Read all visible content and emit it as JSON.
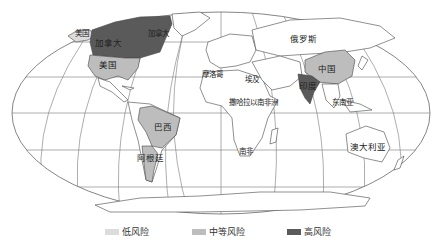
{
  "map": {
    "projection": "robinson-like world map",
    "colors": {
      "ocean": "#ffffff",
      "land": "#ffffff",
      "border": "#555555",
      "graticule": "#777777",
      "low": "#dcdcdc",
      "medium": "#bdbdbd",
      "high": "#5a5a5a"
    },
    "labels": [
      {
        "text": "美国",
        "x": 82,
        "y": 34,
        "small": true
      },
      {
        "text": "加拿大",
        "x": 108,
        "y": 43
      },
      {
        "text": "加拿大",
        "x": 158,
        "y": 34,
        "small": true
      },
      {
        "text": "美国",
        "x": 108,
        "y": 65
      },
      {
        "text": "俄罗斯",
        "x": 303,
        "y": 39
      },
      {
        "text": "中国",
        "x": 327,
        "y": 69
      },
      {
        "text": "印度",
        "x": 308,
        "y": 86
      },
      {
        "text": "摩洛哥",
        "x": 212,
        "y": 75,
        "small": true
      },
      {
        "text": "埃及",
        "x": 252,
        "y": 80,
        "small": true
      },
      {
        "text": "撒哈拉以南非洲",
        "x": 253,
        "y": 103,
        "small": true
      },
      {
        "text": "东南亚",
        "x": 342,
        "y": 103,
        "small": true
      },
      {
        "text": "巴西",
        "x": 163,
        "y": 127
      },
      {
        "text": "阿根廷",
        "x": 150,
        "y": 158
      },
      {
        "text": "南非",
        "x": 246,
        "y": 152,
        "small": true
      },
      {
        "text": "澳大利亚",
        "x": 368,
        "y": 147
      }
    ]
  },
  "legend": {
    "items": [
      {
        "label": "低风险",
        "color": "#dcdcdc",
        "x": 105
      },
      {
        "label": "中等风险",
        "color": "#bdbdbd",
        "x": 192
      },
      {
        "label": "高风险",
        "color": "#5a5a5a",
        "x": 287
      }
    ]
  }
}
